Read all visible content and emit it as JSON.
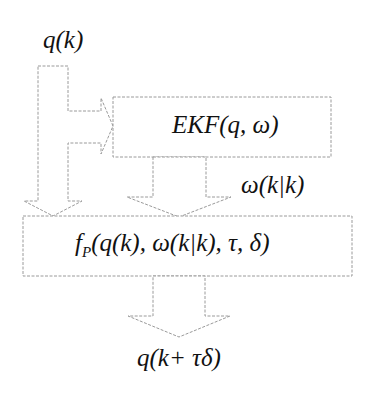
{
  "diagram": {
    "input_label": "q(k)",
    "ekf_block": {
      "label": "EKF(q, ω)"
    },
    "ekf_output_label": "ω(k|k)",
    "predictor_block": {
      "label_f": "f",
      "label_sub": "P",
      "label_args": "(q(k), ω(k|k), τ, δ)"
    },
    "output_label": "q(k+ τδ)",
    "colors": {
      "stroke": "#9a9a9a",
      "text": "#111111",
      "background": "#ffffff"
    }
  }
}
